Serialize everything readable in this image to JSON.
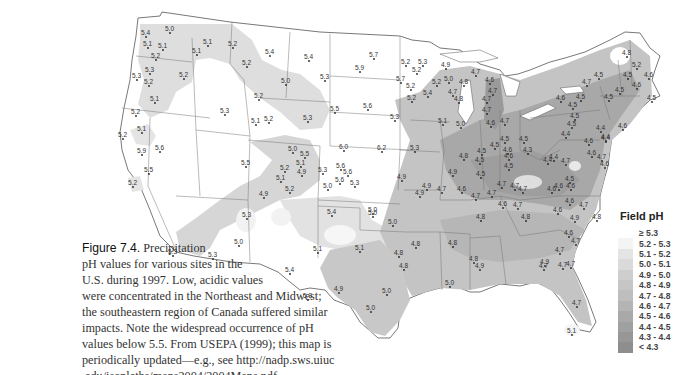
{
  "caption": {
    "figure_label": "Figure 7.4.",
    "lines": [
      "Precipitation",
      "pH values for various sites in the",
      "U.S. during 1997. Low, acidic values",
      "were concentrated in the Northeast and Midwest;",
      "the southeastern region of Canada suffered similar",
      "impacts. Note the widespread occurrence of pH",
      "values below 5.5. From USEPA (1999); this map is",
      "periodically updated—e.g., see http://nadp.sws.uiuc",
      ".edu/isopleths/maps2004/2004Maps.pdf."
    ]
  },
  "legend": {
    "title": "Field pH",
    "items": [
      {
        "label": "≥ 5.3",
        "color": "#ffffff"
      },
      {
        "label": "5.2 - 5.3",
        "color": "#f4f4f4"
      },
      {
        "label": "5.1 - 5.2",
        "color": "#e4e4e4"
      },
      {
        "label": "5.0 - 5.1",
        "color": "#dadada"
      },
      {
        "label": "4.9 - 5.0",
        "color": "#cecece"
      },
      {
        "label": "4.8 - 4.9",
        "color": "#c6c6c6"
      },
      {
        "label": "4.7 - 4.8",
        "color": "#bebebe"
      },
      {
        "label": "4.6 - 4.7",
        "color": "#b4b4b4"
      },
      {
        "label": "4.5 - 4.6",
        "color": "#a9a9a9"
      },
      {
        "label": "4.4 - 4.5",
        "color": "#a0a0a0"
      },
      {
        "label": "4.3 - 4.4",
        "color": "#979797"
      },
      {
        "label": "< 4.3",
        "color": "#8e8e8e"
      }
    ]
  },
  "stations": [
    {
      "v": "5.4",
      "x": 146,
      "y": 33
    },
    {
      "v": "5.0",
      "x": 170,
      "y": 29
    },
    {
      "v": "5.1",
      "x": 148,
      "y": 44
    },
    {
      "v": "5.1",
      "x": 163,
      "y": 46
    },
    {
      "v": "5.2",
      "x": 156,
      "y": 56
    },
    {
      "v": "5.3",
      "x": 150,
      "y": 70
    },
    {
      "v": "5.3",
      "x": 137,
      "y": 76
    },
    {
      "v": "5.2",
      "x": 149,
      "y": 82
    },
    {
      "v": "5.1",
      "x": 155,
      "y": 99
    },
    {
      "v": "5.2",
      "x": 136,
      "y": 112
    },
    {
      "v": "5.1",
      "x": 142,
      "y": 129
    },
    {
      "v": "5.2",
      "x": 123,
      "y": 135
    },
    {
      "v": "5.9",
      "x": 142,
      "y": 151
    },
    {
      "v": "5.6",
      "x": 160,
      "y": 148
    },
    {
      "v": "5.5",
      "x": 149,
      "y": 170
    },
    {
      "v": "5.2",
      "x": 133,
      "y": 183
    },
    {
      "v": "5.1",
      "x": 208,
      "y": 42
    },
    {
      "v": "5.1",
      "x": 197,
      "y": 51
    },
    {
      "v": "5.2",
      "x": 184,
      "y": 75
    },
    {
      "v": "5.2",
      "x": 233,
      "y": 44
    },
    {
      "v": "5.4",
      "x": 270,
      "y": 52
    },
    {
      "v": "5.4",
      "x": 309,
      "y": 57
    },
    {
      "v": "5.3",
      "x": 325,
      "y": 77
    },
    {
      "v": "5.2",
      "x": 247,
      "y": 63
    },
    {
      "v": "5.0",
      "x": 286,
      "y": 81
    },
    {
      "v": "5.2",
      "x": 259,
      "y": 96
    },
    {
      "v": "5.3",
      "x": 225,
      "y": 111
    },
    {
      "v": "5.1",
      "x": 256,
      "y": 121
    },
    {
      "v": "5.2",
      "x": 269,
      "y": 119
    },
    {
      "v": "5.3",
      "x": 308,
      "y": 118
    },
    {
      "v": "5.7",
      "x": 374,
      "y": 55
    },
    {
      "v": "5.9",
      "x": 360,
      "y": 68
    },
    {
      "v": "5.5",
      "x": 335,
      "y": 109
    },
    {
      "v": "5.6",
      "x": 368,
      "y": 106
    },
    {
      "v": "5.3",
      "x": 395,
      "y": 117
    },
    {
      "v": "5.2",
      "x": 406,
      "y": 62
    },
    {
      "v": "5.3",
      "x": 423,
      "y": 62
    },
    {
      "v": "5.2",
      "x": 417,
      "y": 70
    },
    {
      "v": "5.7",
      "x": 401,
      "y": 79
    },
    {
      "v": "5.2",
      "x": 411,
      "y": 86
    },
    {
      "v": "5.2",
      "x": 412,
      "y": 98
    },
    {
      "v": "5.4",
      "x": 428,
      "y": 93
    },
    {
      "v": "5.2",
      "x": 437,
      "y": 82
    },
    {
      "v": "5.0",
      "x": 449,
      "y": 79
    },
    {
      "v": "4.9",
      "x": 446,
      "y": 65
    },
    {
      "v": "4.8",
      "x": 464,
      "y": 82
    },
    {
      "v": "4.7",
      "x": 453,
      "y": 92
    },
    {
      "v": "4.8",
      "x": 459,
      "y": 99
    },
    {
      "v": "5.1",
      "x": 443,
      "y": 121
    },
    {
      "v": "5.0",
      "x": 461,
      "y": 124
    },
    {
      "v": "4.7",
      "x": 476,
      "y": 72
    },
    {
      "v": "4.6",
      "x": 490,
      "y": 80
    },
    {
      "v": "4.7",
      "x": 493,
      "y": 91
    },
    {
      "v": "4.7",
      "x": 487,
      "y": 99
    },
    {
      "v": "4.7",
      "x": 487,
      "y": 110
    },
    {
      "v": "4.6",
      "x": 491,
      "y": 123
    },
    {
      "v": "4.7",
      "x": 505,
      "y": 121
    },
    {
      "v": "4.8",
      "x": 627,
      "y": 53
    },
    {
      "v": "5.2",
      "x": 637,
      "y": 65
    },
    {
      "v": "4.6",
      "x": 649,
      "y": 75
    },
    {
      "v": "4.5",
      "x": 628,
      "y": 75
    },
    {
      "v": "4.6",
      "x": 637,
      "y": 85
    },
    {
      "v": "4.5",
      "x": 620,
      "y": 90
    },
    {
      "v": "4.5",
      "x": 599,
      "y": 75
    },
    {
      "v": "4.5",
      "x": 652,
      "y": 98
    },
    {
      "v": "4.7",
      "x": 587,
      "y": 82
    },
    {
      "v": "4.5",
      "x": 581,
      "y": 97
    },
    {
      "v": "4.6",
      "x": 561,
      "y": 98
    },
    {
      "v": "4.5",
      "x": 609,
      "y": 97
    },
    {
      "v": "4.5",
      "x": 573,
      "y": 105
    },
    {
      "v": "4.5",
      "x": 575,
      "y": 116
    },
    {
      "v": "4.4",
      "x": 601,
      "y": 128
    },
    {
      "v": "4.6",
      "x": 623,
      "y": 126
    },
    {
      "v": "4.5",
      "x": 572,
      "y": 124
    },
    {
      "v": "4.4",
      "x": 566,
      "y": 134
    },
    {
      "v": "4.4",
      "x": 606,
      "y": 137
    },
    {
      "v": "4.6",
      "x": 589,
      "y": 141
    },
    {
      "v": "4.4",
      "x": 606,
      "y": 138
    },
    {
      "v": "4.5",
      "x": 505,
      "y": 139
    },
    {
      "v": "4.5",
      "x": 524,
      "y": 139
    },
    {
      "v": "4.3",
      "x": 528,
      "y": 150
    },
    {
      "v": "4.6",
      "x": 508,
      "y": 150
    },
    {
      "v": "4.4",
      "x": 554,
      "y": 157
    },
    {
      "v": "4.6",
      "x": 592,
      "y": 153
    },
    {
      "v": "4.7",
      "x": 602,
      "y": 157
    },
    {
      "v": "4.6",
      "x": 605,
      "y": 164
    },
    {
      "v": "4.5",
      "x": 482,
      "y": 151
    },
    {
      "v": "4.5",
      "x": 495,
      "y": 145
    },
    {
      "v": "4.8",
      "x": 464,
      "y": 156
    },
    {
      "v": "4.5",
      "x": 480,
      "y": 160
    },
    {
      "v": "4.6",
      "x": 509,
      "y": 156
    },
    {
      "v": "4.5",
      "x": 509,
      "y": 166
    },
    {
      "v": "4.5",
      "x": 481,
      "y": 174
    },
    {
      "v": "4.4",
      "x": 548,
      "y": 160
    },
    {
      "v": "4.7",
      "x": 566,
      "y": 161
    },
    {
      "v": "4.5",
      "x": 570,
      "y": 179
    },
    {
      "v": "4.6",
      "x": 571,
      "y": 186
    },
    {
      "v": "4.7",
      "x": 502,
      "y": 184
    },
    {
      "v": "4.7",
      "x": 515,
      "y": 186
    },
    {
      "v": "4.7",
      "x": 523,
      "y": 189
    },
    {
      "v": "4.6",
      "x": 552,
      "y": 189
    },
    {
      "v": "4.6",
      "x": 559,
      "y": 186
    },
    {
      "v": "4.9",
      "x": 453,
      "y": 172
    },
    {
      "v": "4.9",
      "x": 427,
      "y": 186
    },
    {
      "v": "4.7",
      "x": 442,
      "y": 189
    },
    {
      "v": "4.6",
      "x": 462,
      "y": 189
    },
    {
      "v": "4.7",
      "x": 476,
      "y": 196
    },
    {
      "v": "4.7",
      "x": 492,
      "y": 193
    },
    {
      "v": "4.6",
      "x": 503,
      "y": 204
    },
    {
      "v": "4.7",
      "x": 518,
      "y": 205
    },
    {
      "v": "4.8",
      "x": 526,
      "y": 217
    },
    {
      "v": "4.6",
      "x": 570,
      "y": 201
    },
    {
      "v": "4.6",
      "x": 558,
      "y": 210
    },
    {
      "v": "4.9",
      "x": 575,
      "y": 218
    },
    {
      "v": "4.7",
      "x": 584,
      "y": 205
    },
    {
      "v": "4.8",
      "x": 597,
      "y": 217
    },
    {
      "v": "4.8",
      "x": 481,
      "y": 217
    },
    {
      "v": "4.6",
      "x": 569,
      "y": 233
    },
    {
      "v": "4.7",
      "x": 576,
      "y": 241
    },
    {
      "v": "4.7",
      "x": 560,
      "y": 250
    },
    {
      "v": "4.9",
      "x": 545,
      "y": 262
    },
    {
      "v": "4.7",
      "x": 563,
      "y": 265
    },
    {
      "v": "4.7",
      "x": 571,
      "y": 264
    },
    {
      "v": "4.8",
      "x": 453,
      "y": 243
    },
    {
      "v": "4.8",
      "x": 474,
      "y": 259
    },
    {
      "v": "4.9",
      "x": 480,
      "y": 266
    },
    {
      "v": "5.0",
      "x": 450,
      "y": 283
    },
    {
      "v": "4.7",
      "x": 544,
      "y": 266
    },
    {
      "v": "4.7",
      "x": 577,
      "y": 303
    },
    {
      "v": "5.1",
      "x": 572,
      "y": 331
    },
    {
      "v": "4.9",
      "x": 302,
      "y": 172
    },
    {
      "v": "5.3",
      "x": 323,
      "y": 170
    },
    {
      "v": "5.0",
      "x": 328,
      "y": 186
    },
    {
      "v": "5.6",
      "x": 348,
      "y": 172
    },
    {
      "v": "5.6",
      "x": 341,
      "y": 166
    },
    {
      "v": "5.3",
      "x": 355,
      "y": 183
    },
    {
      "v": "4.9",
      "x": 402,
      "y": 177
    },
    {
      "v": "5.5",
      "x": 246,
      "y": 163
    },
    {
      "v": "5.2",
      "x": 285,
      "y": 168
    },
    {
      "v": "5.1",
      "x": 281,
      "y": 178
    },
    {
      "v": "5.2",
      "x": 290,
      "y": 189
    },
    {
      "v": "5.0",
      "x": 293,
      "y": 149
    },
    {
      "v": "5.5",
      "x": 305,
      "y": 154
    },
    {
      "v": "5.1",
      "x": 301,
      "y": 163
    },
    {
      "v": "6.0",
      "x": 344,
      "y": 147
    },
    {
      "v": "6.2",
      "x": 382,
      "y": 148
    },
    {
      "v": "5.3",
      "x": 415,
      "y": 148
    },
    {
      "v": "5.6",
      "x": 340,
      "y": 180
    },
    {
      "v": "5.4",
      "x": 332,
      "y": 212
    },
    {
      "v": "5.1",
      "x": 360,
      "y": 248
    },
    {
      "v": "5.0",
      "x": 373,
      "y": 210
    },
    {
      "v": "5.1",
      "x": 318,
      "y": 249
    },
    {
      "v": "5.0",
      "x": 373,
      "y": 213
    },
    {
      "v": "4.9",
      "x": 264,
      "y": 194
    },
    {
      "v": "5.3",
      "x": 247,
      "y": 215
    },
    {
      "v": "5.0",
      "x": 239,
      "y": 242
    },
    {
      "v": "5.3",
      "x": 173,
      "y": 252
    },
    {
      "v": "5.3",
      "x": 213,
      "y": 255
    },
    {
      "v": "5.4",
      "x": 290,
      "y": 270
    },
    {
      "v": "5.3",
      "x": 308,
      "y": 296
    },
    {
      "v": "4.9",
      "x": 339,
      "y": 289
    },
    {
      "v": "5.0",
      "x": 387,
      "y": 291
    },
    {
      "v": "5.0",
      "x": 371,
      "y": 308
    },
    {
      "v": "4.8",
      "x": 404,
      "y": 266
    },
    {
      "v": "5.0",
      "x": 393,
      "y": 222
    },
    {
      "v": "4.9",
      "x": 420,
      "y": 193
    },
    {
      "v": "4.8",
      "x": 416,
      "y": 244
    },
    {
      "v": "4.8",
      "x": 399,
      "y": 253
    }
  ]
}
